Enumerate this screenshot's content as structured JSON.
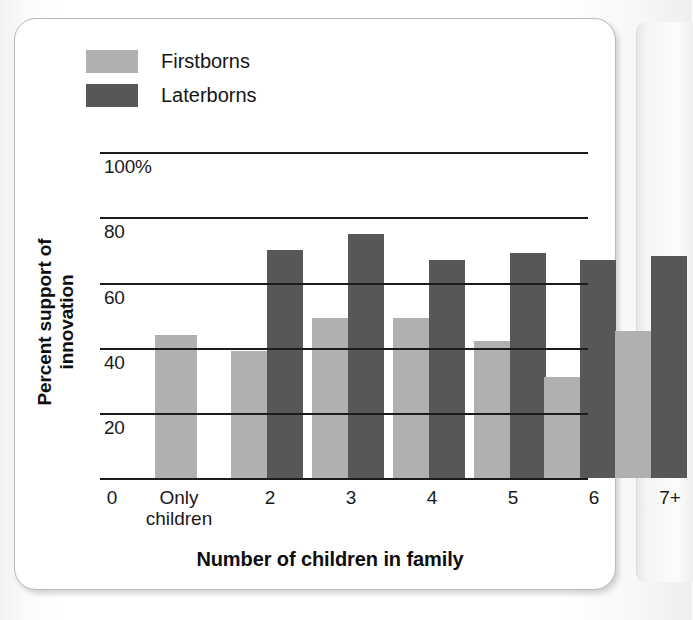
{
  "figure": {
    "panel_bg": "#ffffff",
    "panel_border": "#b9b9b7"
  },
  "legend": {
    "position": "top-left",
    "items": [
      {
        "label": "Firstborns",
        "color": "#b0b0b0",
        "swatch_name": "firstborns-swatch"
      },
      {
        "label": "Laterborns",
        "color": "#575757",
        "swatch_name": "laterborns-swatch"
      }
    ]
  },
  "axes": {
    "y_title": "Percent support of innovation",
    "x_title": "Number of children in family",
    "y_ticks": [
      "100%",
      "80",
      "60",
      "40",
      "20"
    ],
    "y_zero_label": "0"
  },
  "chart_data": {
    "type": "bar",
    "title": "",
    "subtitle": "",
    "xlabel": "Number of children in family",
    "ylabel": "Percent support of innovation",
    "ylim": [
      0,
      100
    ],
    "ytick_values": [
      20,
      40,
      60,
      80,
      100
    ],
    "ytick_labels": [
      "20",
      "40",
      "60",
      "80",
      "100%"
    ],
    "grid": true,
    "grid_axis": "y",
    "legend_position": "top-left",
    "categories": [
      "Only children",
      "2",
      "3",
      "4",
      "5",
      "6",
      "7+"
    ],
    "series": [
      {
        "name": "Firstborns",
        "color": "#b0b0b0",
        "values": [
          44,
          39,
          49,
          49,
          42,
          31,
          45
        ]
      },
      {
        "name": "Laterborns",
        "color": "#575757",
        "values": [
          null,
          70,
          75,
          67,
          69,
          67,
          68
        ]
      }
    ]
  },
  "bars": [
    {
      "name": "only-children-firstborns",
      "series": "Firstborns",
      "category": "Only children",
      "value": 44,
      "x": 155,
      "w": 42
    },
    {
      "name": "two-firstborns",
      "series": "Firstborns",
      "category": "2",
      "value": 39,
      "x": 231,
      "w": 36
    },
    {
      "name": "two-laterborns",
      "series": "Laterborns",
      "category": "2",
      "value": 70,
      "x": 267,
      "w": 36
    },
    {
      "name": "three-firstborns",
      "series": "Firstborns",
      "category": "3",
      "value": 49,
      "x": 312,
      "w": 36
    },
    {
      "name": "three-laterborns",
      "series": "Laterborns",
      "category": "3",
      "value": 75,
      "x": 348,
      "w": 36
    },
    {
      "name": "four-firstborns",
      "series": "Firstborns",
      "category": "4",
      "value": 49,
      "x": 393,
      "w": 36
    },
    {
      "name": "four-laterborns",
      "series": "Laterborns",
      "category": "4",
      "value": 67,
      "x": 429,
      "w": 36
    },
    {
      "name": "five-firstborns",
      "series": "Firstborns",
      "category": "5",
      "value": 42,
      "x": 474,
      "w": 36
    },
    {
      "name": "five-laterborns",
      "series": "Laterborns",
      "category": "5",
      "value": 69,
      "x": 510,
      "w": 36
    },
    {
      "name": "six-firstborns",
      "series": "Firstborns",
      "category": "6",
      "value": 31,
      "x": 544,
      "w": 36
    },
    {
      "name": "six-laterborns",
      "series": "Laterborns",
      "category": "6",
      "value": 67,
      "x": 580,
      "w": 36
    },
    {
      "name": "sevenplus-firstborns",
      "series": "Firstborns",
      "category": "7+",
      "value": 45,
      "x": 615,
      "w": 36
    },
    {
      "name": "sevenplus-laterborns",
      "series": "Laterborns",
      "category": "7+",
      "value": 68,
      "x": 651,
      "w": 36
    }
  ],
  "xtick_labels": [
    {
      "name": "xtick-zero",
      "text": "0",
      "x": 95,
      "w": 34
    },
    {
      "name": "xtick-only-children",
      "text": "Only\nchildren",
      "x": 133,
      "w": 92
    },
    {
      "name": "xtick-2",
      "text": "2",
      "x": 253,
      "w": 34
    },
    {
      "name": "xtick-3",
      "text": "3",
      "x": 334,
      "w": 34
    },
    {
      "name": "xtick-4",
      "text": "4",
      "x": 415,
      "w": 34
    },
    {
      "name": "xtick-5",
      "text": "5",
      "x": 496,
      "w": 34
    },
    {
      "name": "xtick-6",
      "text": "6",
      "x": 577,
      "w": 34
    },
    {
      "name": "xtick-7plus",
      "text": "7+",
      "x": 650,
      "w": 40
    }
  ],
  "geometry": {
    "baseline_y": 478,
    "top_y": 152,
    "px_per_unit": 3.26,
    "grid_left": 100,
    "grid_right": 588,
    "gridlines": [
      {
        "value": 100,
        "y": 152,
        "label": "100%",
        "label_x": 104
      },
      {
        "value": 80,
        "y": 217,
        "label": "80",
        "label_x": 104
      },
      {
        "value": 60,
        "y": 283,
        "label": "60",
        "label_x": 104
      },
      {
        "value": 40,
        "y": 348,
        "label": "40",
        "label_x": 104
      },
      {
        "value": 20,
        "y": 413,
        "label": "20",
        "label_x": 104
      }
    ]
  }
}
